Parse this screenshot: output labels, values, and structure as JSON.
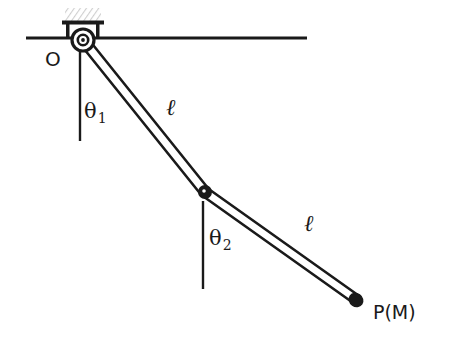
{
  "figure": {
    "background_color": "#ffffff",
    "stroke_color": "#1a1a1a",
    "hatch_color": "#d9d9d9",
    "width": 468,
    "height": 342
  },
  "labels": {
    "pivot": "O",
    "theta1_symbol": "θ",
    "theta1_subscript": "1",
    "theta2_symbol": "θ",
    "theta2_subscript": "2",
    "length1": "ℓ",
    "length2": "ℓ",
    "mass_point": "P(M)"
  },
  "geometry": {
    "ceiling_line": {
      "x1": 26,
      "y1": 38,
      "x2": 307,
      "y2": 38
    },
    "support_block": {
      "x": 65,
      "y": 8,
      "width": 36,
      "height": 13
    },
    "support_bar": {
      "x": 62,
      "y": 21,
      "width": 42,
      "height": 4
    },
    "pivot_point": {
      "x": 83,
      "y": 40,
      "outer_radius": 11,
      "inner_radius": 5
    },
    "mid_joint": {
      "x": 205,
      "y": 192,
      "radius": 6
    },
    "end_point": {
      "x": 357,
      "y": 300,
      "radius": 7
    },
    "rod1": {
      "x1": 83,
      "y1": 40,
      "x2": 205,
      "y2": 192,
      "thickness": 9
    },
    "rod2": {
      "x1": 205,
      "y1": 192,
      "x2": 357,
      "y2": 300,
      "thickness": 9
    },
    "vertical_ref_1": {
      "x": 80,
      "y1": 52,
      "y2": 141
    },
    "vertical_ref_2": {
      "x": 203,
      "y1": 201,
      "y2": 289
    }
  },
  "label_positions": {
    "pivot": {
      "left": 45,
      "top": 49
    },
    "theta1": {
      "left": 84,
      "top": 101
    },
    "theta2": {
      "left": 209,
      "top": 228
    },
    "length1": {
      "left": 166,
      "top": 96
    },
    "length2": {
      "left": 304,
      "top": 212
    },
    "mass_point": {
      "left": 373,
      "top": 303
    }
  }
}
